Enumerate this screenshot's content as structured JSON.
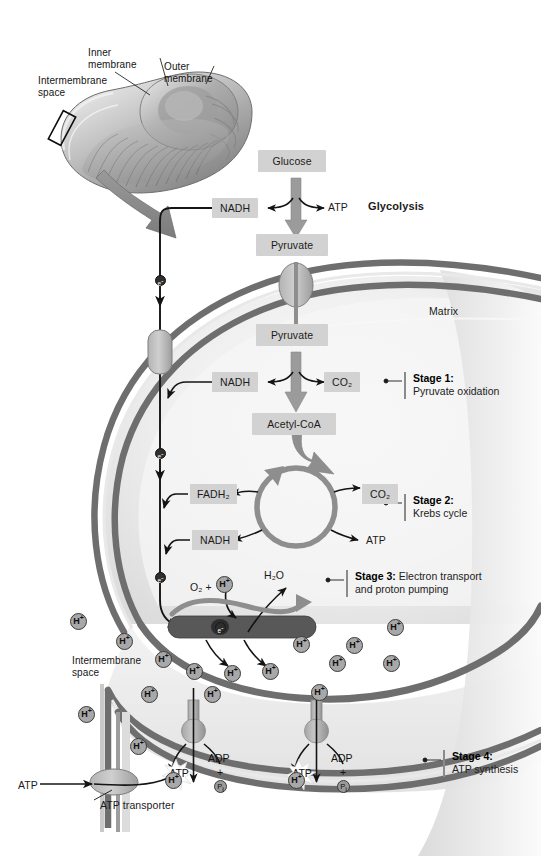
{
  "figure": {
    "background": "#ffffff",
    "membrane_color": "#6e6e6e",
    "matrix_color": "#e4e4e4",
    "box_fill": "#d2d2d2"
  },
  "inset": {
    "labels": [
      {
        "id": "intermembrane-space",
        "text": "Intermembrane\nspace",
        "line1": "Intermembrane",
        "line2": "space"
      },
      {
        "id": "inner-membrane",
        "text": "Inner\nmembrane",
        "line1": "Inner",
        "line2": "membrane"
      },
      {
        "id": "outer-membrane",
        "text": "Outer\nmembrane",
        "line1": "Outer",
        "line2": "membrane"
      }
    ]
  },
  "pathway": {
    "glycolysis": {
      "heading": "Glycolysis",
      "substrate": "Glucose",
      "product": "Pyruvate",
      "outputs": [
        {
          "name": "NADH",
          "boxed": true
        },
        {
          "name": "ATP",
          "boxed": false
        }
      ]
    },
    "stage1": {
      "label": "Stage 1:",
      "name": "Pyruvate oxidation",
      "substrate": "Pyruvate",
      "product": "Acetyl-CoA",
      "outputs": [
        {
          "name": "NADH",
          "boxed": true
        },
        {
          "name": "CO2",
          "display": "CO₂",
          "boxed": true
        }
      ]
    },
    "stage2": {
      "label": "Stage 2:",
      "name": "Krebs cycle",
      "outputs": [
        {
          "name": "FADH2",
          "display": "FADH₂",
          "boxed": true
        },
        {
          "name": "NADH",
          "boxed": true
        },
        {
          "name": "CO2",
          "display": "CO₂",
          "boxed": true
        },
        {
          "name": "ATP",
          "boxed": false
        }
      ]
    },
    "stage3": {
      "label": "Stage 3:",
      "name": "Electron transport",
      "name_line2": "and proton pumping",
      "reactants": "O₂ + ",
      "reactant_ion": "H⁺",
      "product": "H₂O",
      "carrier": "e⁻"
    },
    "stage4": {
      "label": "Stage 4:",
      "name": "ATP synthesis",
      "synthase_outputs": [
        {
          "atp": "ATP",
          "adp": "ADP",
          "plus": "+",
          "pi": "Pi",
          "proton": "H⁺"
        },
        {
          "atp": "ATP",
          "adp": "ADP",
          "plus": "+",
          "pi": "Pi",
          "proton": "H⁺"
        }
      ]
    }
  },
  "compartments": {
    "matrix": "Matrix",
    "intermembrane_space_line1": "Intermembrane",
    "intermembrane_space_line2": "space"
  },
  "transporter": {
    "exported": "ATP",
    "name": "ATP transporter"
  },
  "protons": {
    "symbol": "H",
    "charge": "+",
    "count_intermembrane": 16,
    "count_matrix": 2
  },
  "electrons": {
    "symbol": "e",
    "charge": "-",
    "count_on_chain": 4
  }
}
